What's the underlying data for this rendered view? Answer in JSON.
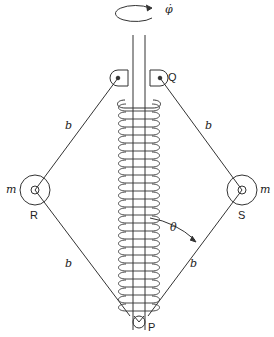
{
  "diagram": {
    "type": "mechanical-governor",
    "labels": {
      "phi_dot": "φ̇",
      "Q": "Q",
      "R": "R",
      "S": "S",
      "P": "P",
      "m_left": "m",
      "m_right": "m",
      "b_upper_left": "b",
      "b_upper_right": "b",
      "b_lower_left": "b",
      "b_lower_right": "b",
      "theta": "θ"
    },
    "nodes": [
      {
        "id": "Q",
        "desc": "upper pivot on shaft"
      },
      {
        "id": "R",
        "desc": "left mass m"
      },
      {
        "id": "S",
        "desc": "right mass m"
      },
      {
        "id": "P",
        "desc": "lower sliding collar"
      }
    ],
    "edges": [
      {
        "from": "Q",
        "to": "R",
        "label": "b"
      },
      {
        "from": "Q",
        "to": "S",
        "label": "b"
      },
      {
        "from": "R",
        "to": "P",
        "label": "b"
      },
      {
        "from": "S",
        "to": "P",
        "label": "b"
      }
    ]
  }
}
